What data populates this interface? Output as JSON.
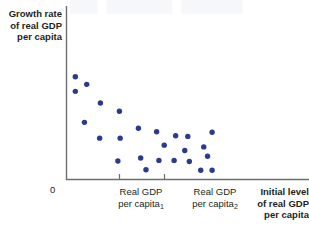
{
  "chart_data": {
    "type": "scatter",
    "title": "",
    "ylabel": "Growth rate\nof real GDP\nper capita",
    "xlabel": "Initial level\nof real GDP\nper capita",
    "origin_label": "0",
    "grid": false,
    "legend": null,
    "xlim": [
      0,
      100
    ],
    "ylim": [
      0,
      100
    ],
    "axis_ticks_x": [
      {
        "value": 32,
        "label_line1": "Real GDP",
        "label_line2": "per capita",
        "label_sub": "1"
      },
      {
        "value": 62,
        "label_line1": "Real GDP",
        "label_line2": "per capita",
        "label_sub": "2"
      }
    ],
    "series": [
      {
        "name": "countries",
        "color": "#2b3a8f",
        "marker": "circle",
        "points": [
          {
            "x": 3.5,
            "y": 84.0
          },
          {
            "x": 3.5,
            "y": 71.5
          },
          {
            "x": 11.0,
            "y": 77.5
          },
          {
            "x": 20.0,
            "y": 61.5
          },
          {
            "x": 9.5,
            "y": 45.0
          },
          {
            "x": 32.5,
            "y": 54.5
          },
          {
            "x": 19.5,
            "y": 31.5
          },
          {
            "x": 45.0,
            "y": 40.0
          },
          {
            "x": 33.0,
            "y": 31.5
          },
          {
            "x": 57.0,
            "y": 37.0
          },
          {
            "x": 69.5,
            "y": 33.5
          },
          {
            "x": 77.5,
            "y": 33.0
          },
          {
            "x": 93.5,
            "y": 36.5
          },
          {
            "x": 62.0,
            "y": 25.5
          },
          {
            "x": 75.5,
            "y": 21.0
          },
          {
            "x": 88.0,
            "y": 24.0
          },
          {
            "x": 90.5,
            "y": 16.0
          },
          {
            "x": 46.5,
            "y": 14.5
          },
          {
            "x": 31.5,
            "y": 12.0
          },
          {
            "x": 58.5,
            "y": 12.5
          },
          {
            "x": 68.5,
            "y": 12.5
          },
          {
            "x": 78.5,
            "y": 11.5
          },
          {
            "x": 50.0,
            "y": 4.5
          },
          {
            "x": 86.0,
            "y": 4.0
          },
          {
            "x": 93.5,
            "y": 4.0
          }
        ]
      }
    ]
  },
  "colors": {
    "marker": "#2b3a8f",
    "axis": "#6d6e71",
    "text": "#231f20"
  }
}
